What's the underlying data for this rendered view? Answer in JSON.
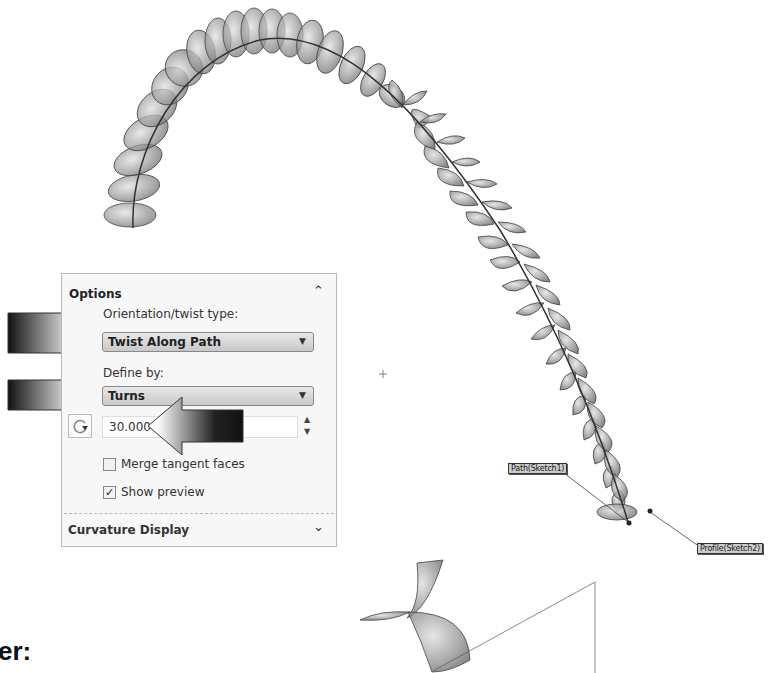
{
  "panel": {
    "title": "Options",
    "collapse_icon": "chevron-up",
    "orientation_label": "Orientation/twist type:",
    "orientation_value": "Twist Along Path",
    "define_label": "Define by:",
    "define_value": "Turns",
    "turns_value": "30.000",
    "reverse_icon": "reverse-direction",
    "merge_tangent_label": "Merge tangent faces",
    "merge_tangent_checked": false,
    "show_preview_label": "Show preview",
    "show_preview_checked": true,
    "check_mark": "✓",
    "curvature_label": "Curvature Display",
    "curvature_expand_icon": "chevron-down"
  },
  "viewport": {
    "path_tag": "Path(Sketch1)",
    "profile_tag": "Profile(Sketch2)"
  },
  "caption": "er:",
  "colors": {
    "panel_bg": "#f7f7f7",
    "dropdown_top": "#e8e8e8",
    "dropdown_bottom": "#c8c8c8",
    "model_fill": "#8a8a8a"
  }
}
